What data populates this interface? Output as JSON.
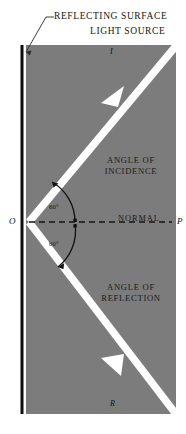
{
  "figure": {
    "type": "optics-ray-diagram",
    "colors": {
      "panel": "#7c7c7c",
      "ray": "#ffffff",
      "surface": "#0d0d0d",
      "text": "#141414",
      "arc": "#121212",
      "normal": "#141414"
    }
  },
  "callouts": {
    "reflecting_surface": "REFLECTING SURFACE",
    "light_source": "LIGHT SOURCE"
  },
  "panel_labels": {
    "angle_of_incidence": "ANGLE OF\nINCIDENCE",
    "angle_of_incidence_line1": "ANGLE OF",
    "angle_of_incidence_line2": "INCIDENCE",
    "angle_of_reflection_line1": "ANGLE OF",
    "angle_of_reflection_line2": "REFLECTION",
    "normal": "NORMAL"
  },
  "points": {
    "o": "O",
    "p": "P",
    "incident_ray": "I",
    "reflected_ray": "R"
  },
  "angles": {
    "incidence": "60°",
    "reflection": "60°"
  },
  "geometry": {
    "panel": {
      "x": 26,
      "y": 45,
      "width": 150,
      "height": 369
    },
    "surface_bar": {
      "x": 20,
      "y": 45,
      "width": 3.5,
      "height": 369
    },
    "vertex": {
      "x": 29,
      "y": 222
    },
    "normal_line": {
      "x1": 29,
      "y1": 222,
      "x2": 172,
      "y2": 222
    },
    "incident_ray": {
      "x1": 176,
      "y1": 45,
      "x2": 29,
      "y2": 222
    },
    "reflected_ray": {
      "x1": 29,
      "y1": 222,
      "x2": 176,
      "y2": 414
    }
  }
}
